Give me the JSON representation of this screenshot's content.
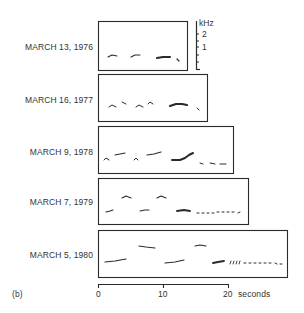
{
  "panel_label": "(b)",
  "colors": {
    "ink": "#2a2a2a",
    "background": "#ffffff"
  },
  "frequency_scale": {
    "unit": "kHz",
    "ticks": [
      "2",
      "1"
    ]
  },
  "time_axis": {
    "ticks": [
      "0",
      "10",
      "20"
    ],
    "unit_label": "seconds"
  },
  "recordings": [
    {
      "label": "MARCH 13, 1976"
    },
    {
      "label": "MARCH 16, 1977"
    },
    {
      "label": "MARCH 9, 1978"
    },
    {
      "label": "MARCH 7, 1979"
    },
    {
      "label": "MARCH 5, 1980"
    }
  ],
  "chart_data": {
    "type": "sonogram-panels",
    "title": "",
    "panel": "(b)",
    "xlabel": "seconds",
    "ylabel": "kHz",
    "x_ticks": [
      0,
      10,
      20
    ],
    "y_ticks": [
      1,
      2
    ],
    "xlim": [
      0,
      20
    ],
    "ylim_khz": [
      0,
      4
    ],
    "series": [
      {
        "name": "MARCH 13, 1976",
        "duration_s": 13.8,
        "box": {
          "x": 98,
          "y": 21,
          "w": 89,
          "h": 49
        },
        "strokes": [
          {
            "pts": [
              [
                108,
                57
              ],
              [
                112,
                55
              ],
              [
                117,
                56
              ]
            ],
            "w": 1.1
          },
          {
            "pts": [
              [
                131,
                57
              ],
              [
                135,
                55
              ],
              [
                140,
                55
              ]
            ],
            "w": 1.1
          },
          {
            "pts": [
              [
                157,
                58
              ],
              [
                163,
                57
              ],
              [
                170,
                57
              ]
            ],
            "w": 2.0
          },
          {
            "pts": [
              [
                177,
                59
              ],
              [
                179,
                61
              ]
            ],
            "w": 1.2
          }
        ]
      },
      {
        "name": "MARCH 16, 1977",
        "duration_s": 16.8,
        "box": {
          "x": 98,
          "y": 74,
          "w": 109,
          "h": 47
        },
        "strokes": [
          {
            "pts": [
              [
                109,
                107
              ],
              [
                112,
                105
              ],
              [
                116,
                107
              ]
            ],
            "w": 1.0
          },
          {
            "pts": [
              [
                122,
                102
              ],
              [
                126,
                104
              ]
            ],
            "w": 1.0
          },
          {
            "pts": [
              [
                136,
                107
              ],
              [
                139,
                105
              ],
              [
                143,
                107
              ]
            ],
            "w": 1.0
          },
          {
            "pts": [
              [
                148,
                104
              ],
              [
                150,
                102
              ],
              [
                153,
                104
              ]
            ],
            "w": 1.0
          },
          {
            "pts": [
              [
                170,
                106
              ],
              [
                176,
                104
              ],
              [
                182,
                104
              ],
              [
                187,
                105
              ]
            ],
            "w": 2.2
          },
          {
            "pts": [
              [
                197,
                108
              ],
              [
                199,
                110
              ]
            ],
            "w": 1.0
          }
        ]
      },
      {
        "name": "MARCH 9, 1978",
        "duration_s": 21.0,
        "box": {
          "x": 98,
          "y": 126,
          "w": 135,
          "h": 47
        },
        "strokes": [
          {
            "pts": [
              [
                104,
                160
              ],
              [
                106,
                158
              ],
              [
                109,
                160
              ]
            ],
            "w": 1.0
          },
          {
            "pts": [
              [
                115,
                155
              ],
              [
                120,
                154
              ],
              [
                125,
                153
              ]
            ],
            "w": 1.2
          },
          {
            "pts": [
              [
                134,
                160
              ],
              [
                136,
                158
              ],
              [
                138,
                160
              ]
            ],
            "w": 1.0
          },
          {
            "pts": [
              [
                147,
                155
              ],
              [
                154,
                154
              ],
              [
                161,
                152
              ]
            ],
            "w": 1.2
          },
          {
            "pts": [
              [
                172,
                160
              ],
              [
                180,
                160
              ],
              [
                185,
                158
              ],
              [
                189,
                155
              ],
              [
                193,
                153
              ]
            ],
            "w": 2.0
          },
          {
            "pts": [
              [
                200,
                163
              ],
              [
                203,
                164
              ]
            ],
            "w": 1.0
          },
          {
            "pts": [
              [
                210,
                163
              ],
              [
                215,
                164
              ]
            ],
            "w": 1.0
          },
          {
            "pts": [
              [
                220,
                164
              ],
              [
                226,
                164
              ]
            ],
            "w": 1.0
          }
        ]
      },
      {
        "name": "MARCH 7, 1979",
        "duration_s": 23.3,
        "box": {
          "x": 98,
          "y": 178,
          "w": 150,
          "h": 46
        },
        "strokes": [
          {
            "pts": [
              [
                106,
                212
              ],
              [
                110,
                211
              ],
              [
                113,
                210
              ]
            ],
            "w": 1.1
          },
          {
            "pts": [
              [
                122,
                198
              ],
              [
                126,
                196
              ],
              [
                131,
                198
              ]
            ],
            "w": 1.1
          },
          {
            "pts": [
              [
                140,
                211
              ],
              [
                145,
                210
              ],
              [
                149,
                210
              ]
            ],
            "w": 1.1
          },
          {
            "pts": [
              [
                157,
                198
              ],
              [
                161,
                196
              ],
              [
                166,
                198
              ]
            ],
            "w": 1.1
          },
          {
            "pts": [
              [
                177,
                211
              ],
              [
                184,
                210
              ],
              [
                190,
                211
              ]
            ],
            "w": 1.8
          },
          {
            "pts": [
              [
                197,
                213
              ],
              [
                199,
                213
              ]
            ],
            "w": 1.0
          },
          {
            "pts": [
              [
                202,
                213
              ],
              [
                204,
                213
              ]
            ],
            "w": 1.0
          },
          {
            "pts": [
              [
                207,
                213
              ],
              [
                209,
                213
              ]
            ],
            "w": 1.0
          },
          {
            "pts": [
              [
                212,
                213
              ],
              [
                214,
                213
              ]
            ],
            "w": 1.0
          },
          {
            "pts": [
              [
                217,
                212
              ],
              [
                219,
                212
              ]
            ],
            "w": 1.0
          },
          {
            "pts": [
              [
                222,
                212
              ],
              [
                224,
                212
              ]
            ],
            "w": 1.0
          },
          {
            "pts": [
              [
                227,
                212
              ],
              [
                229,
                212
              ]
            ],
            "w": 1.0
          },
          {
            "pts": [
              [
                232,
                212
              ],
              [
                234,
                212
              ]
            ],
            "w": 1.0
          },
          {
            "pts": [
              [
                238,
                213
              ],
              [
                240,
                212
              ]
            ],
            "w": 1.0
          }
        ]
      },
      {
        "name": "MARCH 5, 1980",
        "duration_s": 29.5,
        "box": {
          "x": 98,
          "y": 230,
          "w": 189,
          "h": 47
        },
        "strokes": [
          {
            "pts": [
              [
                105,
                262
              ],
              [
                115,
                261
              ],
              [
                126,
                259
              ]
            ],
            "w": 1.2
          },
          {
            "pts": [
              [
                139,
                246
              ],
              [
                146,
                247
              ],
              [
                155,
                248
              ]
            ],
            "w": 1.2
          },
          {
            "pts": [
              [
                165,
                263
              ],
              [
                175,
                262
              ],
              [
                184,
                260
              ]
            ],
            "w": 1.2
          },
          {
            "pts": [
              [
                195,
                246
              ],
              [
                200,
                245
              ],
              [
                206,
                246
              ]
            ],
            "w": 1.2
          },
          {
            "pts": [
              [
                213,
                263
              ],
              [
                218,
                262
              ],
              [
                224,
                261
              ]
            ],
            "w": 1.8
          },
          {
            "pts": [
              [
                230,
                264
              ],
              [
                231,
                261
              ]
            ],
            "w": 0.9
          },
          {
            "pts": [
              [
                233,
                264
              ],
              [
                234,
                261
              ]
            ],
            "w": 0.9
          },
          {
            "pts": [
              [
                236,
                264
              ],
              [
                237,
                261
              ]
            ],
            "w": 0.9
          },
          {
            "pts": [
              [
                239,
                264
              ],
              [
                240,
                261
              ]
            ],
            "w": 0.9
          },
          {
            "pts": [
              [
                244,
                263
              ],
              [
                246,
                263
              ]
            ],
            "w": 1.0
          },
          {
            "pts": [
              [
                249,
                263
              ],
              [
                251,
                263
              ]
            ],
            "w": 1.0
          },
          {
            "pts": [
              [
                254,
                263
              ],
              [
                256,
                263
              ]
            ],
            "w": 1.0
          },
          {
            "pts": [
              [
                259,
                263
              ],
              [
                261,
                263
              ]
            ],
            "w": 1.0
          },
          {
            "pts": [
              [
                264,
                263
              ],
              [
                266,
                263
              ]
            ],
            "w": 1.0
          },
          {
            "pts": [
              [
                269,
                263
              ],
              [
                271,
                263
              ]
            ],
            "w": 1.0
          },
          {
            "pts": [
              [
                275,
                263
              ],
              [
                277,
                264
              ]
            ],
            "w": 1.0
          },
          {
            "pts": [
              [
                280,
                264
              ],
              [
                282,
                264
              ]
            ],
            "w": 1.0
          }
        ]
      }
    ],
    "scale_bar": {
      "x": 196,
      "y0": 21,
      "y1": 70,
      "ticks_y": [
        34,
        41,
        47,
        55,
        62
      ]
    },
    "time_axis_px": {
      "y": 284,
      "x0": 98,
      "x10": 163,
      "x20": 228
    },
    "grid": false,
    "legend": "none"
  }
}
